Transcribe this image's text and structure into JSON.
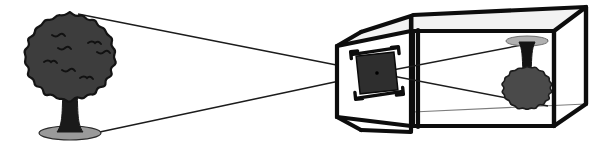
{
  "figure": {
    "background_color": "#ffffff",
    "width": 594,
    "height": 147
  },
  "palette": {
    "ink": "#0d0d0d",
    "ray": "#1c1c1c",
    "canopy_fill": "#3d3d3d",
    "canopy_outline": "#141414",
    "canopy_detail": "#111111",
    "trunk_fill": "#1a1a1a",
    "ground_fill": "#9a9a9a",
    "ground_outline": "#2a2a2a",
    "aperture_fill": "#2e2e2e",
    "aperture_frame": "#0d0d0d",
    "box_line_thick": "#0d0d0d",
    "box_line_thin": "#7c7c7c",
    "box_face": "#ffffff",
    "box_face_shade": "#f2f2f2",
    "image_canopy_fill": "#4a4a4a",
    "image_ground_fill": "#b0b0b0"
  },
  "subject": {
    "name": "tree",
    "label": "Tree (object)",
    "orientation": "upright",
    "canopy": {
      "center_x": 70,
      "center_y": 57,
      "radius_x": 47,
      "radius_y": 45,
      "lobe_count": 22,
      "lobe_depth": 4.5
    },
    "trunk": {
      "top_x": 70,
      "top_y": 88,
      "base_y": 132,
      "top_half_width": 7,
      "base_half_width": 13
    },
    "ground": {
      "center_x": 70,
      "center_y": 133,
      "half_width": 31,
      "half_height": 7
    }
  },
  "projected_image": {
    "name": "inverted-tree-image",
    "label": "Inverted image on back wall",
    "orientation": "inverted",
    "canopy": {
      "center_x": 527,
      "center_y": 88,
      "radius_x": 26,
      "radius_y": 22,
      "lobe_count": 18,
      "lobe_depth": 3
    },
    "trunk": {
      "top_x": 527,
      "top_y": 72,
      "base_y": 42,
      "top_half_width": 4,
      "base_half_width": 8
    },
    "ground": {
      "center_x": 527,
      "center_y": 41,
      "half_width": 21,
      "half_height": 5
    }
  },
  "aperture": {
    "name": "pinhole-aperture",
    "label": "Aperture (pinhole / lens)",
    "center_x": 377,
    "center_y": 73,
    "half_size": 19,
    "rotation_deg": -6,
    "pinhole_radius": 1.8
  },
  "box": {
    "name": "camera-obscura-box",
    "label": "Camera obscura box",
    "front_panel": {
      "top_left_x": 333,
      "top_y": 37,
      "bottom_y": 122,
      "taper": 12
    },
    "divider_x": 417,
    "rear_panel_x": 560
  },
  "light_rays": [
    {
      "id": "ray-from-canopy-top",
      "label": "Ray from top of tree",
      "from": {
        "x": 78,
        "y": 14
      },
      "through": {
        "x": 377,
        "y": 73
      },
      "to": {
        "x": 548,
        "y": 106
      }
    },
    {
      "id": "ray-from-tree-base",
      "label": "Ray from base of tree",
      "from": {
        "x": 95,
        "y": 133
      },
      "through": {
        "x": 377,
        "y": 73
      },
      "to": {
        "x": 548,
        "y": 40
      }
    }
  ]
}
